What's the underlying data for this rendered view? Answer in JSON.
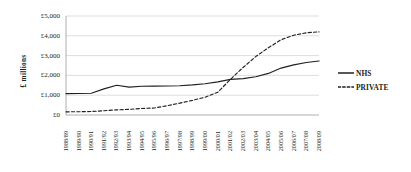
{
  "chart_data": {
    "type": "line",
    "title": "",
    "xlabel": "",
    "ylabel": "£ millions",
    "ylim": [
      0,
      5000
    ],
    "ytick_values": [
      0,
      1000,
      2000,
      3000,
      4000,
      5000
    ],
    "ytick_labels": [
      "£0",
      "£1,000",
      "£2,000",
      "£3,000",
      "£4,000",
      "£5,000"
    ],
    "grid": true,
    "legend_position": "right",
    "categories": [
      "1988/89",
      "1989/90",
      "1990/91",
      "1991/92",
      "1992/93",
      "1993/94",
      "1994/95",
      "1995/96",
      "1996/97",
      "1997/98",
      "1998/99",
      "1999/00",
      "2000/01",
      "2001/02",
      "2002/03",
      "2003/04",
      "2004/05",
      "2005/06",
      "2006/07",
      "2007/08",
      "2008/09"
    ],
    "series": [
      {
        "name": "NHS",
        "style": "solid",
        "color": "#231f20",
        "values": [
          1080,
          1085,
          1100,
          1320,
          1500,
          1405,
          1450,
          1460,
          1465,
          1480,
          1520,
          1580,
          1670,
          1800,
          1840,
          1930,
          2100,
          2370,
          2530,
          2650,
          2730
        ]
      },
      {
        "name": "PRIVATE",
        "style": "dotted",
        "color": "#231f20",
        "values": [
          160,
          165,
          175,
          215,
          260,
          285,
          330,
          355,
          470,
          600,
          740,
          900,
          1150,
          1800,
          2400,
          2950,
          3400,
          3800,
          4030,
          4150,
          4200
        ]
      }
    ]
  },
  "legend": {
    "items": [
      {
        "label": "NHS",
        "style": "solid"
      },
      {
        "label": "PRIVATE",
        "style": "dotted"
      }
    ]
  }
}
